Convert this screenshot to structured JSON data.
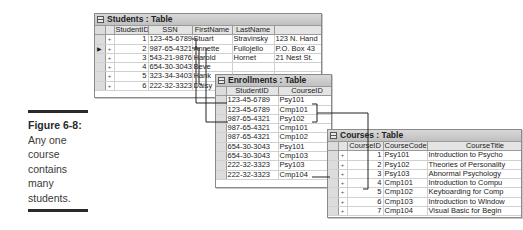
{
  "caption": {
    "figure_label": "Figure 6-8:",
    "lines": [
      "Any one",
      "course",
      "contains",
      "many",
      "students."
    ]
  },
  "students_table": {
    "title": "Students : Table",
    "columns": [
      "StudentID",
      "SSN",
      "FirstName",
      "LastName",
      "Address1"
    ],
    "current_row_indicator": "▶",
    "rows": [
      {
        "StudentID": "1",
        "SSN": "123-45-6789",
        "FirstName": "Stuart",
        "LastName": "Stravinsky",
        "Address1": "123 N. Hand"
      },
      {
        "StudentID": "2",
        "SSN": "987-65-4321",
        "FirstName": "Annette",
        "LastName": "Fullojello",
        "Address1": "P.O. Box 43"
      },
      {
        "StudentID": "3",
        "SSN": "543-21-9876",
        "FirstName": "Harold",
        "LastName": "Hornet",
        "Address1": "21 Nest St."
      },
      {
        "StudentID": "4",
        "SSN": "654-30-3043",
        "FirstName": "Beve",
        "LastName": "",
        "Address1": ""
      },
      {
        "StudentID": "5",
        "SSN": "323-34-3403",
        "FirstName": "Hank",
        "LastName": "",
        "Address1": ""
      },
      {
        "StudentID": "6",
        "SSN": "222-32-3323",
        "FirstName": "Daisy",
        "LastName": "",
        "Address1": ""
      }
    ]
  },
  "enrollments_table": {
    "title": "Enrollments : Table",
    "columns": [
      "StudentID",
      "CourseID"
    ],
    "rows": [
      {
        "StudentID": "123-45-6789",
        "CourseID": "Psy101"
      },
      {
        "StudentID": "123-45-6789",
        "CourseID": "Cmp101"
      },
      {
        "StudentID": "987-65-4321",
        "CourseID": "Psy102"
      },
      {
        "StudentID": "987-65-4321",
        "CourseID": "Cmp101"
      },
      {
        "StudentID": "987-65-4321",
        "CourseID": "Cmp102"
      },
      {
        "StudentID": "654-30-3043",
        "CourseID": "Psy101"
      },
      {
        "StudentID": "654-30-3043",
        "CourseID": "Cmp103"
      },
      {
        "StudentID": "222-32-3323",
        "CourseID": "Psy103"
      },
      {
        "StudentID": "222-32-3323",
        "CourseID": "Cmp104"
      }
    ]
  },
  "courses_table": {
    "title": "Courses : Table",
    "columns": [
      "CourseID",
      "CourseCode",
      "CourseTitle"
    ],
    "rows": [
      {
        "CourseID": "1",
        "CourseCode": "Psy101",
        "CourseTitle": "Introduction to Psycho"
      },
      {
        "CourseID": "2",
        "CourseCode": "Psy102",
        "CourseTitle": "Theories of Personality"
      },
      {
        "CourseID": "3",
        "CourseCode": "Psy103",
        "CourseTitle": "Abnormal Psychology"
      },
      {
        "CourseID": "4",
        "CourseCode": "Cmp101",
        "CourseTitle": "Introduction to Compu"
      },
      {
        "CourseID": "5",
        "CourseCode": "Cmp102",
        "CourseTitle": "Keyboarding for Comp"
      },
      {
        "CourseID": "6",
        "CourseCode": "Cmp103",
        "CourseTitle": "Introduction to Window"
      },
      {
        "CourseID": "7",
        "CourseCode": "Cmp104",
        "CourseTitle": "Visual Basic for Begin"
      }
    ]
  },
  "row_marker": "+"
}
